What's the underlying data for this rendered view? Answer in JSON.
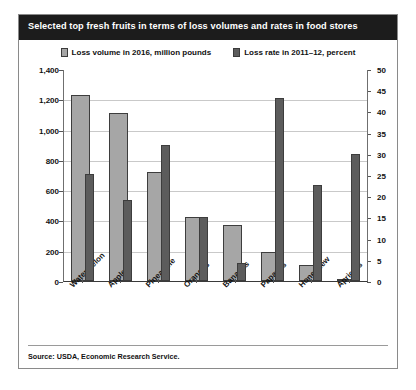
{
  "title": "Selected top fresh fruits in terms of loss volumes and rates in food stores",
  "source": "Source: USDA, Economic Research Service.",
  "legend": {
    "items": [
      {
        "label": "Loss volume in 2016, million pounds",
        "color": "#a6a6a6"
      },
      {
        "label": "Loss rate in 2011–12, percent",
        "color": "#5c5c5c"
      }
    ]
  },
  "chart_data": {
    "type": "bar",
    "title": "Selected top fresh fruits in terms of loss volumes and rates in food stores",
    "xlabel": "",
    "ylabel": "",
    "categories": [
      "Watermelon",
      "Apples",
      "Pineapple",
      "Oranges",
      "Bananas",
      "Papayas",
      "Honeydew",
      "Apricots"
    ],
    "series": [
      {
        "name": "Loss volume in 2016, million pounds",
        "color": "#a6a6a6",
        "axis": "left",
        "values": [
          1230,
          1110,
          720,
          420,
          370,
          190,
          105,
          15
        ]
      },
      {
        "name": "Loss rate in 2011–12, percent",
        "color": "#5c5c5c",
        "axis": "right",
        "values": [
          25.2,
          19.0,
          32.0,
          15.0,
          4.2,
          43.2,
          22.7,
          30.0
        ]
      }
    ],
    "left_axis": {
      "ticks": [
        "1,400",
        "1,200",
        "1,000",
        "800",
        "600",
        "400",
        "200",
        "0"
      ],
      "ylim": [
        0,
        1400
      ]
    },
    "right_axis": {
      "ticks": [
        "50",
        "45",
        "40",
        "35",
        "30",
        "25",
        "20",
        "15",
        "10",
        "5",
        "0"
      ],
      "ylim": [
        0,
        50
      ]
    },
    "grid": true,
    "legend_position": "top"
  }
}
